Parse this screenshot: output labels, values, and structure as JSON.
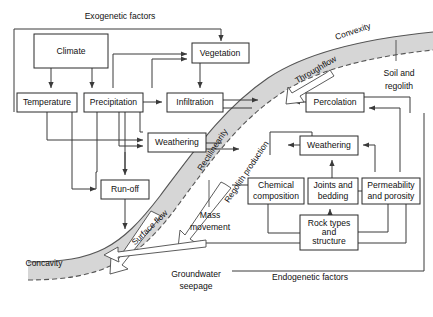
{
  "figure": {
    "caption": "",
    "band_color": "#d6d6d6",
    "box_fill": "#ffffff",
    "line_color": "#3a3a3a"
  },
  "section_labels": {
    "exogenetic": "Exogenetic factors",
    "endogenetic": "Endogenetic factors",
    "soil_regolith_line1": "Soil and",
    "soil_regolith_line2": "regolith"
  },
  "slope_labels": {
    "convexity": "Convexity",
    "rectilinearity": "Rectilinearity",
    "concavity": "Concavity"
  },
  "flow_labels": {
    "throughflow": "Throughflow",
    "surface_flow": "Surface flow",
    "regolith_production": "Regolith production",
    "mass_movement_line1": "Mass",
    "mass_movement_line2": "movement",
    "groundwater_line1": "Groundwater",
    "groundwater_line2": "seepage"
  },
  "boxes": [
    {
      "id": "climate",
      "label": "Climate",
      "lines": [
        "Climate"
      ],
      "x": 34,
      "y": 34,
      "w": 74,
      "h": 34
    },
    {
      "id": "vegetation",
      "label": "Vegetation",
      "lines": [
        "Vegetation"
      ],
      "x": 192,
      "y": 43,
      "w": 57,
      "h": 20
    },
    {
      "id": "temperature",
      "label": "Temperature",
      "lines": [
        "Temperature"
      ],
      "x": 17,
      "y": 93,
      "w": 60,
      "h": 19
    },
    {
      "id": "precipitation",
      "label": "Precipitation",
      "lines": [
        "Precipitation"
      ],
      "x": 84,
      "y": 93,
      "w": 59,
      "h": 19
    },
    {
      "id": "infiltration",
      "label": "Infiltration",
      "lines": [
        "Infiltration"
      ],
      "x": 167,
      "y": 93,
      "w": 56,
      "h": 19
    },
    {
      "id": "percolation",
      "label": "Percolation",
      "lines": [
        "Percolation"
      ],
      "x": 306,
      "y": 93,
      "w": 58,
      "h": 19
    },
    {
      "id": "weathering_l",
      "label": "Weathering",
      "lines": [
        "Weathering"
      ],
      "x": 148,
      "y": 133,
      "w": 58,
      "h": 19
    },
    {
      "id": "weathering_r",
      "label": "Weathering",
      "lines": [
        "Weathering"
      ],
      "x": 300,
      "y": 136,
      "w": 58,
      "h": 19
    },
    {
      "id": "runoff",
      "label": "Run-off",
      "lines": [
        "Run-off"
      ],
      "x": 101,
      "y": 180,
      "w": 48,
      "h": 19
    },
    {
      "id": "chemical",
      "label": "Chemical composition",
      "lines": [
        "Chemical",
        "composition"
      ],
      "x": 248,
      "y": 178,
      "w": 56,
      "h": 26
    },
    {
      "id": "joints",
      "label": "Joints and bedding",
      "lines": [
        "Joints and",
        "bedding"
      ],
      "x": 308,
      "y": 178,
      "w": 50,
      "h": 26
    },
    {
      "id": "permeability",
      "label": "Permeability and porosity",
      "lines": [
        "Permeability",
        "and porosity"
      ],
      "x": 362,
      "y": 178,
      "w": 58,
      "h": 26
    },
    {
      "id": "rocktypes",
      "label": "Rock types and structure",
      "lines": [
        "Rock types",
        "and",
        "structure"
      ],
      "x": 300,
      "y": 215,
      "w": 58,
      "h": 35
    }
  ]
}
